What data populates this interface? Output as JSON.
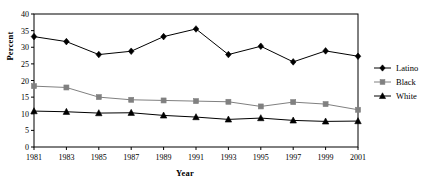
{
  "chart_data": {
    "type": "line",
    "title": "",
    "xlabel": "Year",
    "ylabel": "Percent",
    "x": [
      1981,
      1983,
      1985,
      1987,
      1989,
      1991,
      1993,
      1995,
      1997,
      1999,
      2001
    ],
    "xtick_labels": [
      "1981",
      "1983",
      "1985",
      "1987",
      "1989",
      "1991",
      "1993",
      "1995",
      "1997",
      "1999",
      "2001"
    ],
    "ytick_labels": [
      "0",
      "5",
      "10",
      "15",
      "20",
      "25",
      "30",
      "35",
      "40"
    ],
    "yticks": [
      0,
      5,
      10,
      15,
      20,
      25,
      30,
      35,
      40
    ],
    "ylim": [
      0,
      40
    ],
    "xlim": [
      1981,
      2001
    ],
    "grid": false,
    "legend_position": "right",
    "series": [
      {
        "name": "Latino",
        "color": "#000000",
        "marker": "diamond",
        "values": [
          33.2,
          31.7,
          27.8,
          28.8,
          33.2,
          35.5,
          27.8,
          30.3,
          25.6,
          28.9,
          27.3
        ]
      },
      {
        "name": "Black",
        "color": "#808080",
        "marker": "square",
        "values": [
          18.3,
          17.9,
          15.0,
          14.2,
          14.0,
          13.8,
          13.6,
          12.2,
          13.5,
          12.9,
          11.2
        ]
      },
      {
        "name": "White",
        "color": "#000000",
        "marker": "triangle",
        "values": [
          10.8,
          10.6,
          10.2,
          10.3,
          9.5,
          9.0,
          8.3,
          8.7,
          8.0,
          7.7,
          7.8
        ]
      }
    ]
  },
  "legend": {
    "items": [
      {
        "label": "Latino"
      },
      {
        "label": "Black"
      },
      {
        "label": "White"
      }
    ]
  },
  "axes": {
    "x_title": "Year",
    "y_title": "Percent"
  }
}
